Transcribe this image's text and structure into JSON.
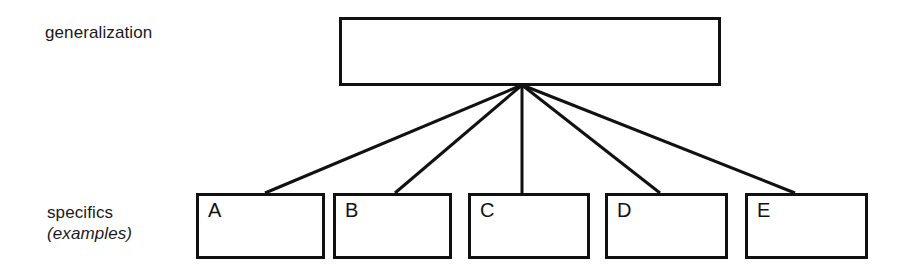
{
  "diagram": {
    "title_text": "",
    "background_color": "#ffffff",
    "stroke_color": "#111111",
    "text_color": "#1a1a1a",
    "labels": {
      "top_row_label": "generalization",
      "bottom_row_label_line1": "specifics",
      "bottom_row_label_line2": "(examples)"
    },
    "root_node": {
      "name": "generalization-box",
      "label": "",
      "x": 339,
      "y": 17,
      "width": 382,
      "height": 69
    },
    "fan_origin": {
      "x": 522,
      "y": 85
    },
    "leaf_nodes": [
      {
        "label": "A",
        "x": 196,
        "width": 129,
        "connect_x": 265
      },
      {
        "label": "B",
        "x": 333,
        "width": 119,
        "connect_x": 395
      },
      {
        "label": "C",
        "x": 468,
        "width": 122,
        "connect_x": 522
      },
      {
        "label": "D",
        "x": 605,
        "width": 123,
        "connect_x": 660
      },
      {
        "label": "E",
        "x": 745,
        "width": 123,
        "connect_x": 795
      }
    ],
    "leaf_row": {
      "y": 193,
      "height": 66
    },
    "connectors": [
      {
        "from_x": 522,
        "from_y": 85,
        "to_x": 265,
        "to_y": 193
      },
      {
        "from_x": 522,
        "from_y": 85,
        "to_x": 395,
        "to_y": 193
      },
      {
        "from_x": 522,
        "from_y": 85,
        "to_x": 522,
        "to_y": 193
      },
      {
        "from_x": 522,
        "from_y": 85,
        "to_x": 660,
        "to_y": 193
      },
      {
        "from_x": 522,
        "from_y": 85,
        "to_x": 795,
        "to_y": 193
      }
    ]
  }
}
